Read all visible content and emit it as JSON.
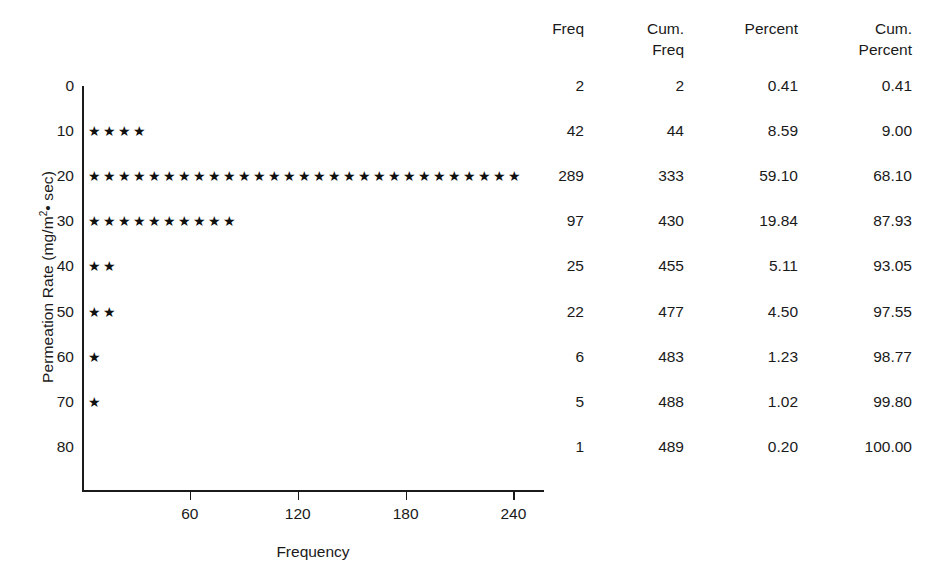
{
  "chart_data": {
    "type": "scatter",
    "title": "",
    "xlabel": "Frequency",
    "ylabel": "Permeation Rate (mg/m2 • sec)",
    "ylabel_prefix": "Permeation Rate (mg/m",
    "ylabel_sup": "2",
    "ylabel_suffix": "• sec)",
    "plot_style": "dot-plot of star glyphs, each star ≈ 10 units of frequency",
    "glyph": "★",
    "grid": false,
    "legend": false,
    "xlim": [
      0,
      260
    ],
    "ylim": [
      0,
      80
    ],
    "x_ticks": [
      60,
      120,
      180,
      240
    ],
    "y_ticks": [
      0,
      10,
      20,
      30,
      40,
      50,
      60,
      70,
      80
    ],
    "categories": [
      0,
      10,
      20,
      30,
      40,
      50,
      60,
      70,
      80
    ],
    "values": [
      2,
      42,
      289,
      97,
      25,
      22,
      6,
      5,
      1
    ],
    "star_counts": [
      0,
      4,
      29,
      10,
      2,
      2,
      1,
      1,
      0
    ],
    "series": [
      {
        "name": "Freq",
        "values": [
          2,
          42,
          289,
          97,
          25,
          22,
          6,
          5,
          1
        ]
      }
    ],
    "colors": {
      "axis": "#1a1a1a",
      "marker": "#111111",
      "background": "#ffffff"
    }
  },
  "table": {
    "headers": [
      {
        "line1": "Freq",
        "line2": ""
      },
      {
        "line1": "Cum.",
        "line2": "Freq"
      },
      {
        "line1": "Percent",
        "line2": ""
      },
      {
        "line1": "Cum.",
        "line2": "Percent"
      }
    ],
    "rows": [
      {
        "freq": "2",
        "cum_freq": "2",
        "percent": "0.41",
        "cum_percent": "0.41"
      },
      {
        "freq": "42",
        "cum_freq": "44",
        "percent": "8.59",
        "cum_percent": "9.00"
      },
      {
        "freq": "289",
        "cum_freq": "333",
        "percent": "59.10",
        "cum_percent": "68.10"
      },
      {
        "freq": "97",
        "cum_freq": "430",
        "percent": "19.84",
        "cum_percent": "87.93"
      },
      {
        "freq": "25",
        "cum_freq": "455",
        "percent": "5.11",
        "cum_percent": "93.05"
      },
      {
        "freq": "22",
        "cum_freq": "477",
        "percent": "4.50",
        "cum_percent": "97.55"
      },
      {
        "freq": "6",
        "cum_freq": "483",
        "percent": "1.23",
        "cum_percent": "98.77"
      },
      {
        "freq": "5",
        "cum_freq": "488",
        "percent": "1.02",
        "cum_percent": "99.80"
      },
      {
        "freq": "1",
        "cum_freq": "489",
        "percent": "0.20",
        "cum_percent": "100.00"
      }
    ]
  }
}
